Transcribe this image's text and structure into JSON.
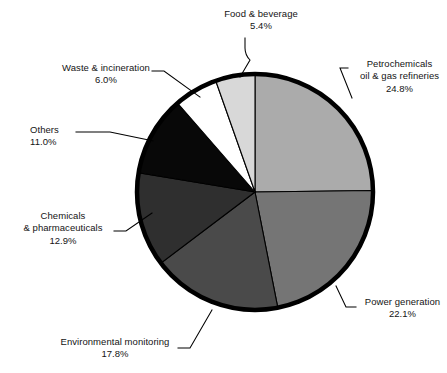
{
  "chart_data": {
    "type": "pie",
    "title": "",
    "subtitle": "",
    "xlabel": "",
    "ylabel": "",
    "legend_position": "callout-labels",
    "grid": false,
    "start_angle_deg": 0,
    "direction": "clockwise",
    "categories": [
      "Petrochemicals oil & gas refineries",
      "Power generation",
      "Environmental monitoring",
      "Chemicals & pharmaceuticals",
      "Others",
      "Waste & incineration",
      "Food & beverage"
    ],
    "values": [
      24.8,
      22.1,
      17.8,
      12.9,
      11.0,
      6.0,
      5.4
    ],
    "value_suffix": "%",
    "slices": [
      {
        "label_line1": "Petrochemicals",
        "label_line2": "oil & gas refineries",
        "percent": "24.8%",
        "value": 24.8,
        "color": "#ababab"
      },
      {
        "label_line1": "Power generation",
        "label_line2": "",
        "percent": "22.1%",
        "value": 22.1,
        "color": "#757575"
      },
      {
        "label_line1": "Environmental monitoring",
        "label_line2": "",
        "percent": "17.8%",
        "value": 17.8,
        "color": "#4a4a4a"
      },
      {
        "label_line1": "Chemicals",
        "label_line2": "& pharmaceuticals",
        "percent": "12.9%",
        "value": 12.9,
        "color": "#2f2f2f"
      },
      {
        "label_line1": "Others",
        "label_line2": "",
        "percent": "11.0%",
        "value": 11.0,
        "color": "#080808"
      },
      {
        "label_line1": "Waste & incineration",
        "label_line2": "",
        "percent": "6.0%",
        "value": 6.0,
        "color": "#ffffff"
      },
      {
        "label_line1": "Food & beverage",
        "label_line2": "",
        "percent": "5.4%",
        "value": 5.4,
        "color": "#d8d8d8"
      }
    ]
  },
  "style": {
    "background": "#ffffff",
    "outline_color": "#000000",
    "divider_color": "#000000",
    "label_color": "#141414",
    "leader_color": "#000000"
  }
}
